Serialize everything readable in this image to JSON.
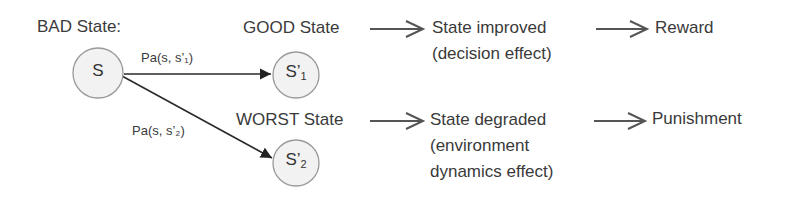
{
  "diagram": {
    "source_label": "BAD State:",
    "nodes": [
      {
        "id": "s",
        "label": "S",
        "sub": ""
      },
      {
        "id": "s1",
        "label": "S’",
        "sub": "1"
      },
      {
        "id": "s2",
        "label": "S’",
        "sub": "2"
      }
    ],
    "edges": [
      {
        "from": "s",
        "to": "s1",
        "label": "Pa(s, s’₁)"
      },
      {
        "from": "s",
        "to": "s2",
        "label": "Pa(s, s’₂)"
      }
    ],
    "rows": [
      {
        "state_label": "GOOD State",
        "effect_lines": [
          "State improved",
          "(decision effect)"
        ],
        "outcome": "Reward"
      },
      {
        "state_label": "WORST State",
        "effect_lines": [
          "State degraded",
          "(environment",
          "dynamics effect)"
        ],
        "outcome": "Punishment"
      }
    ],
    "colors": {
      "text": "#3a3a3a",
      "node_fill": "#f2f2f2",
      "node_stroke": "#999999",
      "edge": "#2a2a2a",
      "flow_arrow": "#555555"
    }
  }
}
